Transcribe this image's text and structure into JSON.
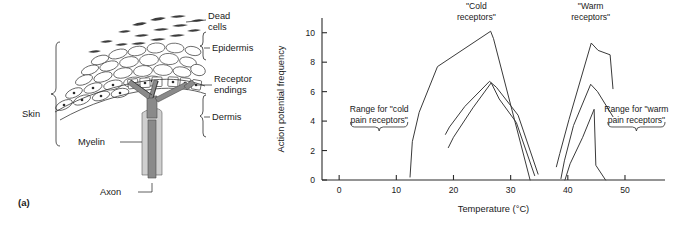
{
  "figure": {
    "panel_label": "(a)"
  },
  "anatomy": {
    "title": "Skin receptor anatomy",
    "labels": {
      "dead_cells_line1": "Dead",
      "dead_cells_line2": "cells",
      "epidermis": "Epidermis",
      "receptor_line1": "Receptor",
      "receptor_line2": "endings",
      "dermis": "Dermis",
      "skin": "Skin",
      "myelin": "Myelin",
      "axon": "Axon"
    }
  },
  "chart_data": {
    "type": "line",
    "title": "",
    "xlabel": "Temperature (°C)",
    "ylabel": "Action potential frequency",
    "xlim": [
      -3,
      57
    ],
    "ylim": [
      0,
      11
    ],
    "xticks": [
      0,
      10,
      20,
      30,
      40,
      50
    ],
    "yticks": [
      0,
      2,
      4,
      6,
      8,
      10
    ],
    "grid": false,
    "legend": "none",
    "annotations": [
      {
        "name": "cold-receptors-label",
        "line1": "\"Cold",
        "line2": "receptors\"",
        "x": 24,
        "y": 11.6
      },
      {
        "name": "warm-receptors-label",
        "line1": "\"Warm",
        "line2": "receptors\"",
        "x": 44,
        "y": 11.6
      },
      {
        "name": "cold-pain-range-label",
        "line1": "Range for \"cold",
        "line2": "pain receptors\"",
        "x": 7,
        "y": 4.6
      },
      {
        "name": "warm-pain-range-label",
        "line1": "Range for \"warm",
        "line2": "pain receptors\"",
        "x": 52,
        "y": 4.6
      }
    ],
    "braces": [
      {
        "name": "cold-pain-range-brace",
        "x_start": 2,
        "x_end": 12,
        "y": 3.6
      },
      {
        "name": "warm-pain-range-brace",
        "x_start": 47,
        "x_end": 57,
        "y": 3.6
      }
    ],
    "series": [
      {
        "name": "cold-receptor-1",
        "group": "cold",
        "x": [
          12.4,
          12.8,
          14.0,
          17.2,
          26.5,
          27.0,
          33.4
        ],
        "y": [
          0.2,
          2.6,
          4.6,
          7.7,
          10.1,
          9.6,
          0.0
        ]
      },
      {
        "name": "cold-receptor-2",
        "group": "cold",
        "x": [
          18.6,
          19.3,
          22.0,
          26.3,
          27.5,
          31.3,
          34.8
        ],
        "y": [
          3.1,
          3.6,
          5.0,
          6.7,
          6.3,
          4.4,
          0.4
        ]
      },
      {
        "name": "cold-receptor-3",
        "group": "cold",
        "x": [
          19.1,
          20.0,
          23.4,
          26.6,
          28.0,
          31.0,
          34.2
        ],
        "y": [
          2.2,
          2.9,
          4.9,
          6.6,
          5.5,
          3.9,
          0.3
        ]
      },
      {
        "name": "warm-receptor-1",
        "group": "warm",
        "x": [
          38.0,
          38.6,
          40.2,
          44.1,
          45.3,
          47.4,
          47.9
        ],
        "y": [
          0.9,
          1.8,
          4.1,
          9.3,
          8.8,
          8.5,
          6.2
        ]
      },
      {
        "name": "warm-receptor-2",
        "group": "warm",
        "x": [
          38.8,
          39.4,
          41.0,
          44.0,
          45.2,
          47.9
        ],
        "y": [
          0.1,
          1.3,
          3.7,
          6.5,
          6.0,
          4.3
        ]
      },
      {
        "name": "warm-receptor-3",
        "group": "warm",
        "x": [
          39.5,
          40.4,
          42.6,
          44.6,
          44.9,
          46.6
        ],
        "y": [
          0.0,
          1.1,
          2.9,
          4.8,
          1.0,
          0.0
        ]
      }
    ]
  }
}
